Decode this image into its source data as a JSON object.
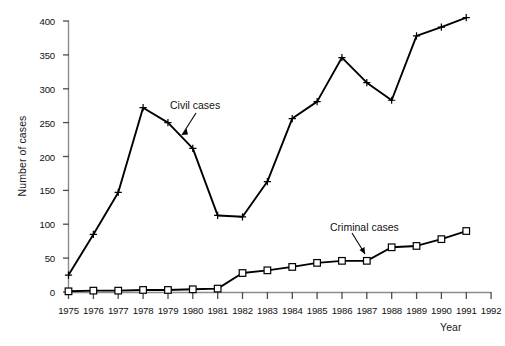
{
  "chart_data": {
    "type": "line",
    "title": "",
    "xlabel": "Year",
    "ylabel": "Number of cases",
    "xlim": [
      1975,
      1992
    ],
    "ylim": [
      0,
      400
    ],
    "ytick_step": 50,
    "grid": false,
    "legend_position": "inline-annotations",
    "xticks": [
      "1975",
      "1976",
      "1977",
      "1978",
      "1979",
      "1980",
      "1981",
      "1982",
      "1983",
      "1984",
      "1985",
      "1986",
      "1987",
      "1988",
      "1989",
      "1990",
      "1991",
      "1992"
    ],
    "yticks": [
      "0",
      "50",
      "100",
      "150",
      "200",
      "250",
      "300",
      "350",
      "400"
    ],
    "x": [
      1975,
      1976,
      1977,
      1978,
      1979,
      1980,
      1981,
      1982,
      1983,
      1984,
      1985,
      1986,
      1987,
      1988,
      1989,
      1990,
      1991
    ],
    "series": [
      {
        "name": "Civil cases",
        "marker": "plus",
        "values": [
          25,
          85,
          147,
          272,
          250,
          212,
          113,
          111,
          163,
          256,
          281,
          346,
          309,
          283,
          378,
          391,
          405
        ]
      },
      {
        "name": "Criminal cases",
        "marker": "square",
        "values": [
          1,
          2,
          2,
          3,
          3,
          4,
          5,
          28,
          32,
          37,
          43,
          46,
          46,
          66,
          68,
          78,
          90
        ]
      }
    ],
    "annotations": [
      {
        "text": "Civil cases",
        "points_to_series": "Civil cases",
        "points_to_x": 1980
      },
      {
        "text": "Criminal cases",
        "points_to_series": "Criminal cases",
        "points_to_x": 1987
      }
    ],
    "colors": {
      "line": "#000000",
      "marker_fill": "#ffffff",
      "axis": "#8c8c8c"
    }
  }
}
